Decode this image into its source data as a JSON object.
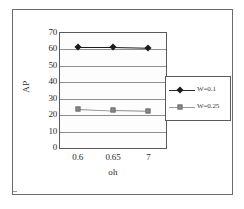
{
  "chart_data": {
    "type": "line",
    "title": "",
    "xlabel": "oh",
    "ylabel": "AP",
    "categories": [
      "0.6",
      "0.65",
      "7"
    ],
    "ylim": [
      0,
      70
    ],
    "yticks": [
      0,
      10,
      20,
      30,
      40,
      50,
      60,
      70
    ],
    "ytick_labels": [
      "0",
      "10",
      "20",
      "30",
      "40",
      "50",
      "60",
      "70"
    ],
    "grid": "horizontal",
    "legend_position": "right",
    "series": [
      {
        "name": "W=0.1",
        "marker": "diamond",
        "color": "#1c1c1c",
        "values": [
          61.5,
          61.5,
          61
        ]
      },
      {
        "name": "W=0.25",
        "marker": "square",
        "color": "#8a8a8a",
        "values": [
          24,
          23,
          22.5
        ]
      }
    ]
  },
  "figure": {
    "border_color": "#6b6b6b",
    "background": "#ffffff"
  }
}
